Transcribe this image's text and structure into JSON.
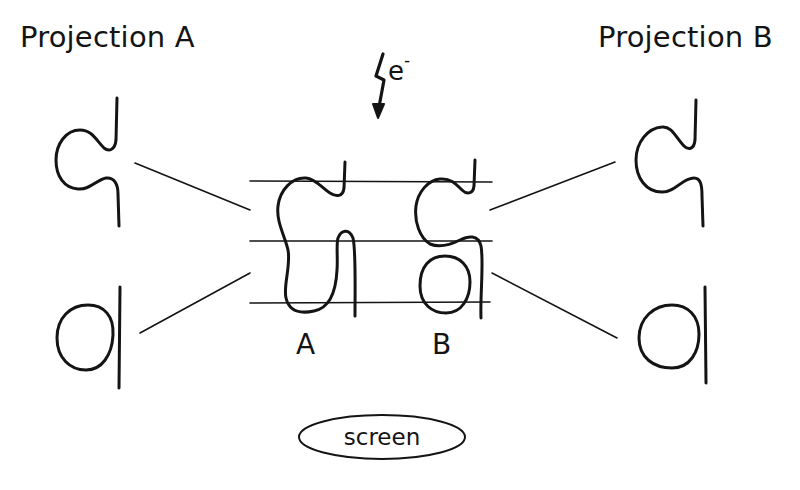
{
  "projection_a": {
    "title": "Projection A"
  },
  "projection_b": {
    "title": "Projection B"
  },
  "beam": {
    "label": "e",
    "superscript": "-",
    "icon": "lightning-arrow-icon"
  },
  "molecules": [
    {
      "id": "A",
      "label": "A"
    },
    {
      "id": "B",
      "label": "B"
    }
  ],
  "screen": {
    "label": "screen"
  },
  "colors": {
    "ink": "#141414",
    "background": "#ffffff"
  }
}
